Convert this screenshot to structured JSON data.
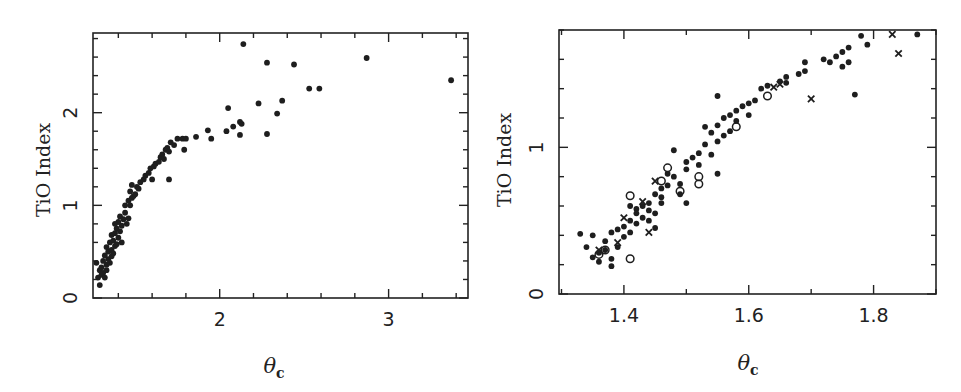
{
  "chart_data": [
    {
      "type": "scatter",
      "title": "",
      "xlabel": "θ_c",
      "ylabel": "TiO Index",
      "xlim": [
        1.25,
        3.47
      ],
      "ylim": [
        0,
        2.86
      ],
      "x_major_ticks": [
        2,
        3
      ],
      "x_major_tick_labels": [
        "2",
        "3"
      ],
      "x_minor_step": 0.2,
      "y_major_ticks": [
        0,
        1,
        2
      ],
      "y_major_tick_labels": [
        "0",
        "1",
        "2"
      ],
      "y_minor_step": 0.2,
      "grid": false,
      "legend": null,
      "frame_px": {
        "left": 93,
        "top": 33,
        "right": 468,
        "bottom": 298
      },
      "series": [
        {
          "name": "stars",
          "marker": "filled-circle",
          "points": [
            [
              1.29,
              0.14
            ],
            [
              1.28,
              0.22
            ],
            [
              1.3,
              0.25
            ],
            [
              1.29,
              0.3
            ],
            [
              1.31,
              0.27
            ],
            [
              1.27,
              0.38
            ],
            [
              1.3,
              0.33
            ],
            [
              1.32,
              0.22
            ],
            [
              1.33,
              0.3
            ],
            [
              1.31,
              0.4
            ],
            [
              1.33,
              0.36
            ],
            [
              1.34,
              0.42
            ],
            [
              1.32,
              0.46
            ],
            [
              1.35,
              0.38
            ],
            [
              1.36,
              0.45
            ],
            [
              1.34,
              0.5
            ],
            [
              1.33,
              0.55
            ],
            [
              1.36,
              0.52
            ],
            [
              1.37,
              0.48
            ],
            [
              1.35,
              0.6
            ],
            [
              1.38,
              0.56
            ],
            [
              1.37,
              0.62
            ],
            [
              1.39,
              0.58
            ],
            [
              1.36,
              0.68
            ],
            [
              1.38,
              0.7
            ],
            [
              1.4,
              0.65
            ],
            [
              1.39,
              0.75
            ],
            [
              1.41,
              0.72
            ],
            [
              1.4,
              0.82
            ],
            [
              1.38,
              0.8
            ],
            [
              1.42,
              0.78
            ],
            [
              1.41,
              0.88
            ],
            [
              1.43,
              0.85
            ],
            [
              1.42,
              0.6
            ],
            [
              1.44,
              0.92
            ],
            [
              1.45,
              0.8
            ],
            [
              1.46,
              0.86
            ],
            [
              1.44,
              1.0
            ],
            [
              1.46,
              1.05
            ],
            [
              1.47,
              1.0
            ],
            [
              1.48,
              1.08
            ],
            [
              1.49,
              1.1
            ],
            [
              1.47,
              1.15
            ],
            [
              1.5,
              1.12
            ],
            [
              1.48,
              1.22
            ],
            [
              1.51,
              1.2
            ],
            [
              1.52,
              1.18
            ],
            [
              1.53,
              1.25
            ],
            [
              1.55,
              1.28
            ],
            [
              1.56,
              1.32
            ],
            [
              1.58,
              1.35
            ],
            [
              1.59,
              1.4
            ],
            [
              1.61,
              1.42
            ],
            [
              1.62,
              1.45
            ],
            [
              1.6,
              1.28
            ],
            [
              1.64,
              1.47
            ],
            [
              1.65,
              1.52
            ],
            [
              1.66,
              1.55
            ],
            [
              1.67,
              1.5
            ],
            [
              1.68,
              1.6
            ],
            [
              1.69,
              1.62
            ],
            [
              1.7,
              1.58
            ],
            [
              1.71,
              1.68
            ],
            [
              1.7,
              1.28
            ],
            [
              1.73,
              1.65
            ],
            [
              1.75,
              1.72
            ],
            [
              1.78,
              1.72
            ],
            [
              1.79,
              1.6
            ],
            [
              1.8,
              1.72
            ],
            [
              1.86,
              1.74
            ],
            [
              1.93,
              1.81
            ],
            [
              1.95,
              1.72
            ],
            [
              2.04,
              1.8
            ],
            [
              2.05,
              2.05
            ],
            [
              2.08,
              1.85
            ],
            [
              2.12,
              1.9
            ],
            [
              2.13,
              1.88
            ],
            [
              2.12,
              1.76
            ],
            [
              2.14,
              2.74
            ],
            [
              2.23,
              2.1
            ],
            [
              2.28,
              2.54
            ],
            [
              2.28,
              1.77
            ],
            [
              2.34,
              1.99
            ],
            [
              2.37,
              2.13
            ],
            [
              2.44,
              2.52
            ],
            [
              2.53,
              2.26
            ],
            [
              2.59,
              2.26
            ],
            [
              2.87,
              2.59
            ],
            [
              3.37,
              2.35
            ]
          ]
        }
      ]
    },
    {
      "type": "scatter",
      "title": "",
      "xlabel": "θ_c",
      "ylabel": "TiO Index",
      "xlim": [
        1.296,
        1.9
      ],
      "ylim": [
        0,
        1.8
      ],
      "x_major_ticks": [
        1.4,
        1.6,
        1.8
      ],
      "x_major_tick_labels": [
        "1.4",
        "1.6",
        "1.8"
      ],
      "x_minor_step": 0.1,
      "y_major_ticks": [
        0,
        1
      ],
      "y_major_tick_labels": [
        "0",
        "1"
      ],
      "y_minor_step": 0.2,
      "grid": false,
      "legend": null,
      "frame_px": {
        "left": 559,
        "top": 30,
        "right": 936,
        "bottom": 294
      },
      "series": [
        {
          "name": "filled",
          "marker": "filled-circle",
          "points": [
            [
              1.33,
              0.41
            ],
            [
              1.34,
              0.32
            ],
            [
              1.35,
              0.4
            ],
            [
              1.35,
              0.25
            ],
            [
              1.36,
              0.28
            ],
            [
              1.36,
              0.22
            ],
            [
              1.37,
              0.36
            ],
            [
              1.37,
              0.3
            ],
            [
              1.38,
              0.24
            ],
            [
              1.38,
              0.19
            ],
            [
              1.39,
              0.32
            ],
            [
              1.38,
              0.42
            ],
            [
              1.39,
              0.44
            ],
            [
              1.4,
              0.46
            ],
            [
              1.4,
              0.39
            ],
            [
              1.41,
              0.5
            ],
            [
              1.41,
              0.42
            ],
            [
              1.42,
              0.58
            ],
            [
              1.41,
              0.6
            ],
            [
              1.42,
              0.55
            ],
            [
              1.43,
              0.6
            ],
            [
              1.42,
              0.48
            ],
            [
              1.43,
              0.52
            ],
            [
              1.44,
              0.57
            ],
            [
              1.44,
              0.5
            ],
            [
              1.45,
              0.55
            ],
            [
              1.45,
              0.45
            ],
            [
              1.44,
              0.62
            ],
            [
              1.46,
              0.62
            ],
            [
              1.45,
              0.68
            ],
            [
              1.46,
              0.72
            ],
            [
              1.47,
              0.74
            ],
            [
              1.46,
              0.66
            ],
            [
              1.48,
              0.8
            ],
            [
              1.47,
              0.82
            ],
            [
              1.48,
              0.98
            ],
            [
              1.49,
              0.68
            ],
            [
              1.49,
              0.75
            ],
            [
              1.5,
              0.85
            ],
            [
              1.5,
              0.9
            ],
            [
              1.5,
              0.62
            ],
            [
              1.51,
              0.93
            ],
            [
              1.52,
              0.88
            ],
            [
              1.52,
              0.96
            ],
            [
              1.53,
              1.02
            ],
            [
              1.53,
              1.14
            ],
            [
              1.54,
              1.1
            ],
            [
              1.54,
              0.95
            ],
            [
              1.55,
              1.04
            ],
            [
              1.55,
              1.15
            ],
            [
              1.55,
              0.82
            ],
            [
              1.56,
              1.2
            ],
            [
              1.56,
              1.08
            ],
            [
              1.57,
              1.22
            ],
            [
              1.57,
              1.11
            ],
            [
              1.58,
              1.18
            ],
            [
              1.58,
              1.25
            ],
            [
              1.59,
              1.28
            ],
            [
              1.55,
              1.35
            ],
            [
              1.6,
              1.3
            ],
            [
              1.61,
              1.32
            ],
            [
              1.6,
              1.22
            ],
            [
              1.62,
              1.4
            ],
            [
              1.63,
              1.42
            ],
            [
              1.65,
              1.45
            ],
            [
              1.66,
              1.48
            ],
            [
              1.66,
              1.44
            ],
            [
              1.68,
              1.5
            ],
            [
              1.69,
              1.52
            ],
            [
              1.69,
              1.58
            ],
            [
              1.72,
              1.6
            ],
            [
              1.73,
              1.58
            ],
            [
              1.74,
              1.62
            ],
            [
              1.75,
              1.65
            ],
            [
              1.75,
              1.55
            ],
            [
              1.76,
              1.58
            ],
            [
              1.76,
              1.68
            ],
            [
              1.77,
              1.36
            ],
            [
              1.78,
              1.76
            ],
            [
              1.79,
              1.7
            ],
            [
              1.87,
              1.77
            ]
          ]
        },
        {
          "name": "open",
          "marker": "open-circle",
          "points": [
            [
              1.36,
              0.27
            ],
            [
              1.37,
              0.3
            ],
            [
              1.41,
              0.24
            ],
            [
              1.41,
              0.67
            ],
            [
              1.46,
              0.77
            ],
            [
              1.47,
              0.86
            ],
            [
              1.49,
              0.7
            ],
            [
              1.52,
              0.8
            ],
            [
              1.52,
              0.75
            ],
            [
              1.58,
              1.14
            ],
            [
              1.63,
              1.35
            ]
          ]
        },
        {
          "name": "cross",
          "marker": "x",
          "points": [
            [
              1.36,
              0.3
            ],
            [
              1.39,
              0.35
            ],
            [
              1.4,
              0.52
            ],
            [
              1.43,
              0.63
            ],
            [
              1.44,
              0.42
            ],
            [
              1.45,
              0.77
            ],
            [
              1.64,
              1.41
            ],
            [
              1.65,
              1.43
            ],
            [
              1.7,
              1.33
            ],
            [
              1.83,
              1.77
            ],
            [
              1.84,
              1.64
            ]
          ]
        }
      ]
    }
  ],
  "panels": {
    "left": {
      "ylabel": "TiO Index",
      "xlabel_symbol": "θ",
      "xlabel_subscript": "c"
    },
    "right": {
      "ylabel": "TiO Index",
      "xlabel_symbol": "θ",
      "xlabel_subscript": "c"
    }
  }
}
